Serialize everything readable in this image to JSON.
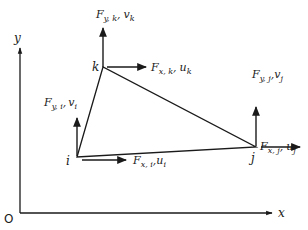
{
  "diagram": {
    "type": "triangular finite element with nodal forces and displacements",
    "axes": {
      "origin_label": "O",
      "x_label": "x",
      "y_label": "y"
    },
    "nodes": [
      {
        "id": "i",
        "label": "i",
        "force_x_label": {
          "F": "F",
          "sub": "x, i",
          "sep": ",",
          "disp": "u",
          "disp_sub": "i"
        },
        "force_y_label": {
          "F": "F",
          "sub": "y, i",
          "sep": ",",
          "disp": "v",
          "disp_sub": "i"
        }
      },
      {
        "id": "j",
        "label": "j",
        "force_x_label": {
          "F": "F",
          "sub": "x, j",
          "sep": ",",
          "disp": "u",
          "disp_sub": "j"
        },
        "force_y_label": {
          "F": "F",
          "sub": "y, j",
          "sep": ",",
          "disp": "v",
          "disp_sub": "j"
        }
      },
      {
        "id": "k",
        "label": "k",
        "force_x_label": {
          "F": "F",
          "sub": "x, k",
          "sep": ",",
          "disp": "u",
          "disp_sub": "k"
        },
        "force_y_label": {
          "F": "F",
          "sub": "y, k",
          "sep": ",",
          "disp": "v",
          "disp_sub": "k"
        }
      }
    ],
    "colors": {
      "ink": "#1a1a1a",
      "background": "#ffffff"
    }
  }
}
